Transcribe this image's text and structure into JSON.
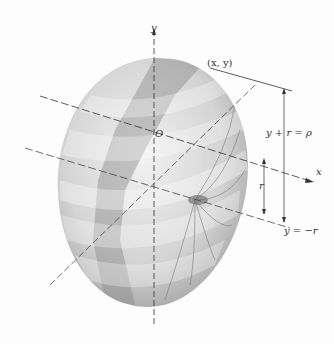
{
  "figure": {
    "colors": {
      "background": "#fdfdfd",
      "surface_light": "#e8e8e8",
      "surface_mid": "#bdbdbd",
      "surface_dark": "#8a8a8a",
      "line": "#333333"
    }
  },
  "labels": {
    "y_axis": "y",
    "x_axis": "x",
    "origin": "O",
    "point": "(x, y)",
    "outer_dim": "y + r = ρ",
    "inner_dim": "r",
    "bottom_line": "y = −r"
  }
}
